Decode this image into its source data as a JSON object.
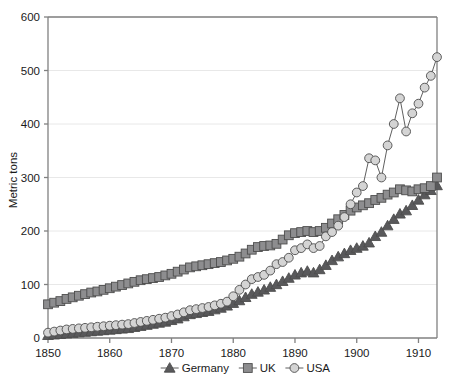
{
  "chart_data": {
    "type": "line",
    "title": "",
    "xlabel": "",
    "ylabel": "Metric tons",
    "xlim": [
      1850,
      1913
    ],
    "ylim": [
      0,
      600
    ],
    "grid": true,
    "grid_axis": "y",
    "legend_position": "bottom",
    "xticks": [
      1850,
      1860,
      1870,
      1880,
      1890,
      1900,
      1910
    ],
    "xtick_labels": [
      "1850",
      "1860",
      "1870",
      "1880",
      "1890",
      "1900",
      "1910"
    ],
    "yticks": [
      0,
      100,
      200,
      300,
      400,
      500,
      600
    ],
    "ytick_labels": [
      "0",
      "100",
      "200",
      "300",
      "400",
      "500",
      "600"
    ],
    "x": [
      1850,
      1851,
      1852,
      1853,
      1854,
      1855,
      1856,
      1857,
      1858,
      1859,
      1860,
      1861,
      1862,
      1863,
      1864,
      1865,
      1866,
      1867,
      1868,
      1869,
      1870,
      1871,
      1872,
      1873,
      1874,
      1875,
      1876,
      1877,
      1878,
      1879,
      1880,
      1881,
      1882,
      1883,
      1884,
      1885,
      1886,
      1887,
      1888,
      1889,
      1890,
      1891,
      1892,
      1893,
      1894,
      1895,
      1896,
      1897,
      1898,
      1899,
      1900,
      1901,
      1902,
      1903,
      1904,
      1905,
      1906,
      1907,
      1908,
      1909,
      1910,
      1911,
      1912,
      1913
    ],
    "series": [
      {
        "name": "Germany",
        "marker": "triangle",
        "color": "#59595b",
        "values": [
          5,
          6,
          7,
          8,
          9,
          10,
          11,
          12,
          13,
          14,
          15,
          16,
          17,
          18,
          20,
          22,
          24,
          26,
          28,
          30,
          33,
          36,
          40,
          44,
          46,
          48,
          50,
          53,
          56,
          60,
          65,
          70,
          76,
          82,
          86,
          90,
          95,
          100,
          106,
          112,
          118,
          122,
          125,
          122,
          128,
          136,
          145,
          152,
          158,
          164,
          168,
          172,
          178,
          190,
          198,
          210,
          222,
          232,
          238,
          248,
          258,
          268,
          276,
          285
        ]
      },
      {
        "name": "UK",
        "marker": "square",
        "color": "#8d8d8f",
        "values": [
          63,
          66,
          69,
          73,
          76,
          79,
          82,
          85,
          87,
          90,
          93,
          96,
          99,
          102,
          105,
          108,
          110,
          112,
          114,
          117,
          120,
          124,
          128,
          132,
          134,
          136,
          138,
          140,
          142,
          145,
          148,
          152,
          158,
          165,
          170,
          172,
          173,
          176,
          184,
          192,
          196,
          198,
          200,
          198,
          200,
          206,
          214,
          222,
          230,
          238,
          244,
          248,
          252,
          258,
          262,
          268,
          272,
          278,
          276,
          274,
          278,
          280,
          284,
          300
        ]
      },
      {
        "name": "USA",
        "marker": "circle",
        "color": "#d4d4d4",
        "values": [
          10,
          12,
          14,
          16,
          17,
          18,
          19,
          20,
          21,
          22,
          23,
          24,
          25,
          26,
          28,
          30,
          32,
          34,
          36,
          38,
          41,
          44,
          48,
          52,
          54,
          56,
          58,
          61,
          64,
          68,
          78,
          90,
          100,
          110,
          114,
          118,
          126,
          138,
          142,
          150,
          164,
          168,
          175,
          168,
          172,
          190,
          198,
          210,
          226,
          250,
          272,
          284,
          336,
          332,
          300,
          360,
          400,
          448,
          386,
          420,
          438,
          468,
          490,
          525
        ]
      }
    ]
  },
  "axis": {
    "y_title": "Metric tons"
  },
  "legend": {
    "entries": [
      {
        "label": "Germany",
        "marker": "triangle",
        "color": "#59595b"
      },
      {
        "label": "UK",
        "marker": "square",
        "color": "#8d8d8f"
      },
      {
        "label": "USA",
        "marker": "circle",
        "color": "#d4d4d4"
      }
    ]
  },
  "colors": {
    "background": "#ffffff",
    "axis_line": "#808080",
    "gridline": "#e8e8e8",
    "text": "#1a1a1a",
    "marker_edge": "#4d4d4d",
    "germany": "#59595b",
    "uk": "#8d8d8f",
    "usa": "#d4d4d4"
  }
}
